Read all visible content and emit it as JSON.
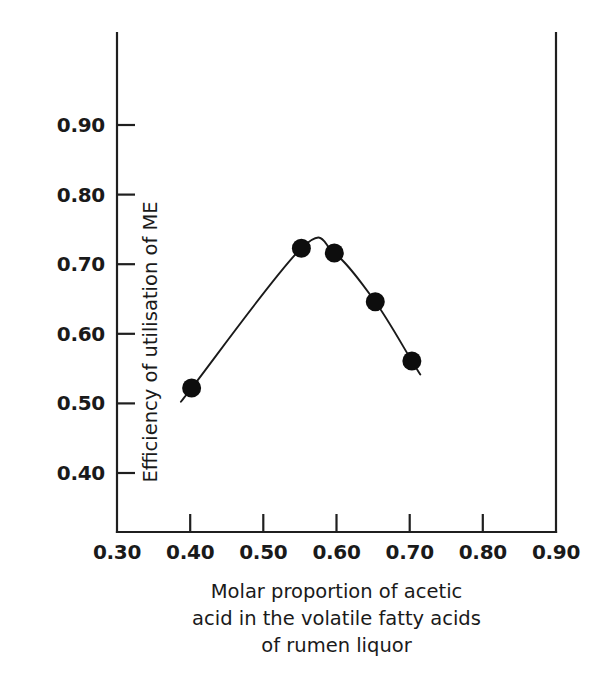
{
  "chart_data": {
    "type": "scatter",
    "title": "",
    "xlabel": "Molar proportion of acetic acid in the volatile fatty acids of rumen liquor",
    "ylabel": "Efficiency of utilisation of ME",
    "xlim": [
      0.3,
      0.9
    ],
    "ylim": [
      0.3,
      0.95
    ],
    "grid": false,
    "legend": null,
    "xticks": [
      "0.30",
      "0.40",
      "0.50",
      "0.60",
      "0.70",
      "0.80",
      "0.90"
    ],
    "xtick_values": [
      0.3,
      0.4,
      0.5,
      0.6,
      0.7,
      0.8,
      0.9
    ],
    "yticks": [
      "0.40",
      "0.50",
      "0.60",
      "0.70",
      "0.80",
      "0.90"
    ],
    "ytick_values": [
      0.4,
      0.5,
      0.6,
      0.7,
      0.8,
      0.9
    ],
    "series": [
      {
        "name": "Efficiency of utilisation of ME",
        "marker": "filled-circle",
        "marker_color": "#0d0d0d",
        "line_color": "#1a1a1a",
        "x": [
          0.402,
          0.552,
          0.597,
          0.653,
          0.703
        ],
        "y": [
          0.522,
          0.723,
          0.716,
          0.646,
          0.561
        ]
      }
    ],
    "curve_fit": "quadratic smoothing curve through points, extended slightly beyond first and last marker"
  },
  "axis_labels": {
    "y_title": "Efficiency of utilisation of ME",
    "x_title_line1": "Molar proportion of acetic",
    "x_title_line2": "acid in the volatile fatty acids",
    "x_title_line3": "of rumen liquor"
  },
  "colors": {
    "axis": "#1f1f1f",
    "marker": "#0d0d0d",
    "curve": "#1a1a1a",
    "background": "#ffffff",
    "text": "#1a1a1a"
  }
}
